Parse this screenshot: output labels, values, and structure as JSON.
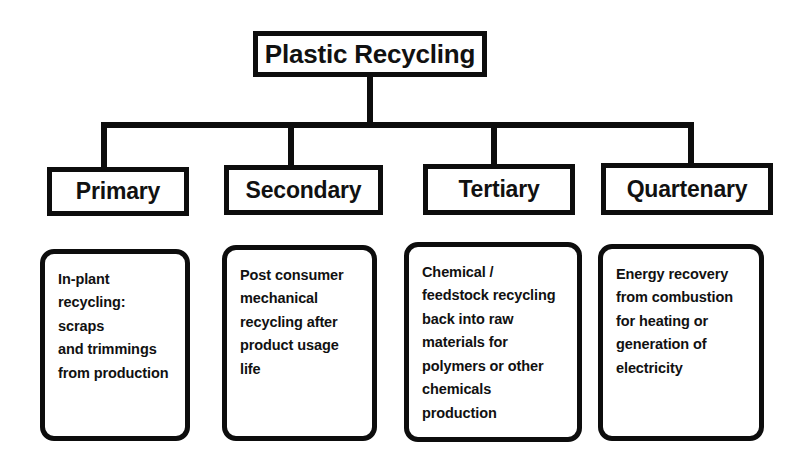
{
  "diagram": {
    "title": "Plastic Recycling",
    "type": "hierarchy-tree",
    "root_label": "Plastic Recycling",
    "line_color": "#0d0d0d",
    "box_fill": "#ffffff",
    "background": "#ffffff",
    "branches": [
      {
        "id": "primary",
        "label": "Primary",
        "description": "In-plant\nrecycling: scraps\nand trimmings\nfrom production"
      },
      {
        "id": "secondary",
        "label": "Secondary",
        "description": "Post consumer\nmechanical\nrecycling after\nproduct usage\nlife"
      },
      {
        "id": "tertiary",
        "label": "Tertiary",
        "description": "Chemical /\nfeedstock recycling\nback into raw\nmaterials for\npolymers or other\nchemicals\nproduction"
      },
      {
        "id": "quartenary",
        "label": "Quartenary",
        "description": "Energy recovery\nfrom combustion\nfor heating or\ngeneration of\nelectricity"
      }
    ]
  }
}
